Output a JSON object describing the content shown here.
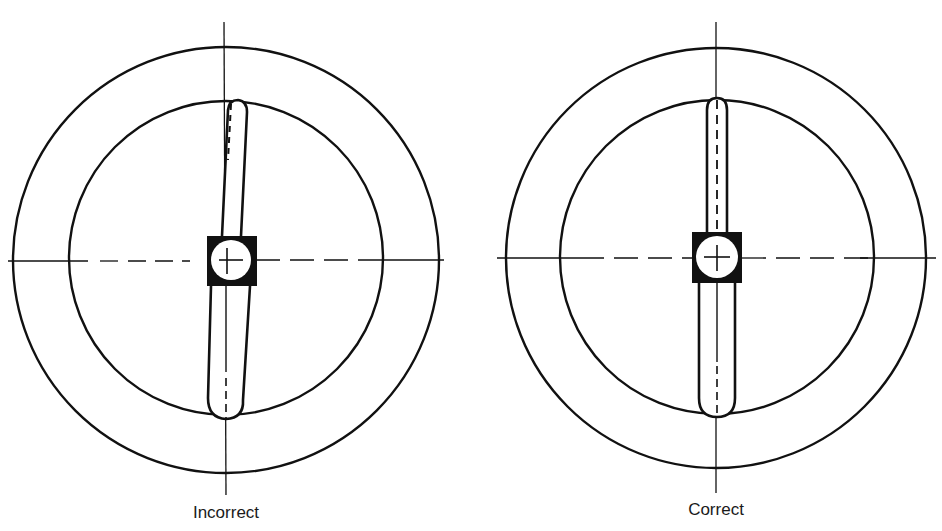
{
  "figures": [
    {
      "id": "incorrect",
      "caption": "Incorrect",
      "center": [
        226,
        260
      ],
      "outer_radius": 213,
      "inner_radius": 158,
      "arm_alignment": "misaligned"
    },
    {
      "id": "correct",
      "caption": "Correct",
      "center": [
        716,
        258
      ],
      "outer_radius": 210,
      "inner_radius": 158,
      "arm_alignment": "aligned"
    }
  ],
  "colors": {
    "stroke": "#111111",
    "background": "#ffffff"
  }
}
